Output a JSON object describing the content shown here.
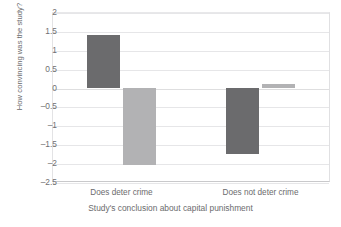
{
  "chart_data": {
    "type": "bar",
    "title": "",
    "xlabel": "Study's conclusion about capital punishment",
    "ylabel": "How convincing was the study?",
    "categories": [
      "Does deter crime",
      "Does not deter crime"
    ],
    "series": [
      {
        "name": "dark-series",
        "color": "#6b6b6d",
        "values": [
          1.4,
          -1.75
        ]
      },
      {
        "name": "light-series",
        "color": "#b2b2b4",
        "values": [
          -2.05,
          0.1
        ]
      }
    ],
    "ylim": [
      -2.5,
      2
    ],
    "yticks": [
      2,
      1.5,
      1,
      0.5,
      0,
      -0.5,
      -1,
      -1.5,
      -2,
      -2.5
    ],
    "ytick_labels": [
      "2",
      "1.5",
      "1",
      "0.5",
      "0",
      "–0.5",
      "–1",
      "–1.5",
      "–2",
      "–2.5"
    ],
    "grid": true,
    "legend": "none",
    "zero_line": 0
  }
}
